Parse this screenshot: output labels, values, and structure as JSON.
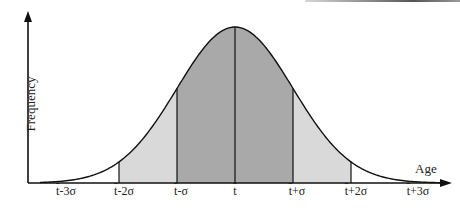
{
  "chart_data": {
    "type": "area",
    "title": "",
    "subtitle": "Normal distribution of age with standard-deviation bands",
    "xlabel": "Age",
    "ylabel": "Frequency",
    "grid": false,
    "legend": null,
    "distribution": "normal",
    "mean_label": "t̄",
    "sigma_symbol": "σ",
    "x_ticks": [
      "t̄-3σ",
      "t̄-2σ",
      "t̄-σ",
      "t̄",
      "t̄+σ",
      "t̄+2σ",
      "t̄+3σ"
    ],
    "x_tick_sigma": [
      -3,
      -2,
      -1,
      0,
      1,
      2,
      3
    ],
    "bands": [
      {
        "from_sigma": -2,
        "to_sigma": -1,
        "shade": "light",
        "color": "#d9d9d9"
      },
      {
        "from_sigma": -1,
        "to_sigma": 0,
        "shade": "dark",
        "color": "#a9a9a9"
      },
      {
        "from_sigma": 0,
        "to_sigma": 1,
        "shade": "dark",
        "color": "#a9a9a9"
      },
      {
        "from_sigma": 1,
        "to_sigma": 2,
        "shade": "light",
        "color": "#d9d9d9"
      }
    ],
    "vertical_lines_sigma": [
      -2,
      -1,
      0,
      1,
      2
    ],
    "relative_heights": [
      {
        "sigma": -3,
        "value": 0.011
      },
      {
        "sigma": -2,
        "value": 0.135
      },
      {
        "sigma": -1,
        "value": 0.607
      },
      {
        "sigma": 0,
        "value": 1.0
      },
      {
        "sigma": 1,
        "value": 0.607
      },
      {
        "sigma": 2,
        "value": 0.135
      },
      {
        "sigma": 3,
        "value": 0.011
      }
    ]
  },
  "axes": {
    "x_label": "Age",
    "y_label": "Frequency"
  },
  "ticks": {
    "m3": "-3σ",
    "m2": "-2σ",
    "m1": "-σ",
    "zero": "",
    "p1": "+σ",
    "p2": "+2σ",
    "p3": "+3σ",
    "t": "t"
  },
  "colors": {
    "dark_band": "#a9a9a9",
    "light_band": "#d9d9d9",
    "line": "#111111"
  }
}
